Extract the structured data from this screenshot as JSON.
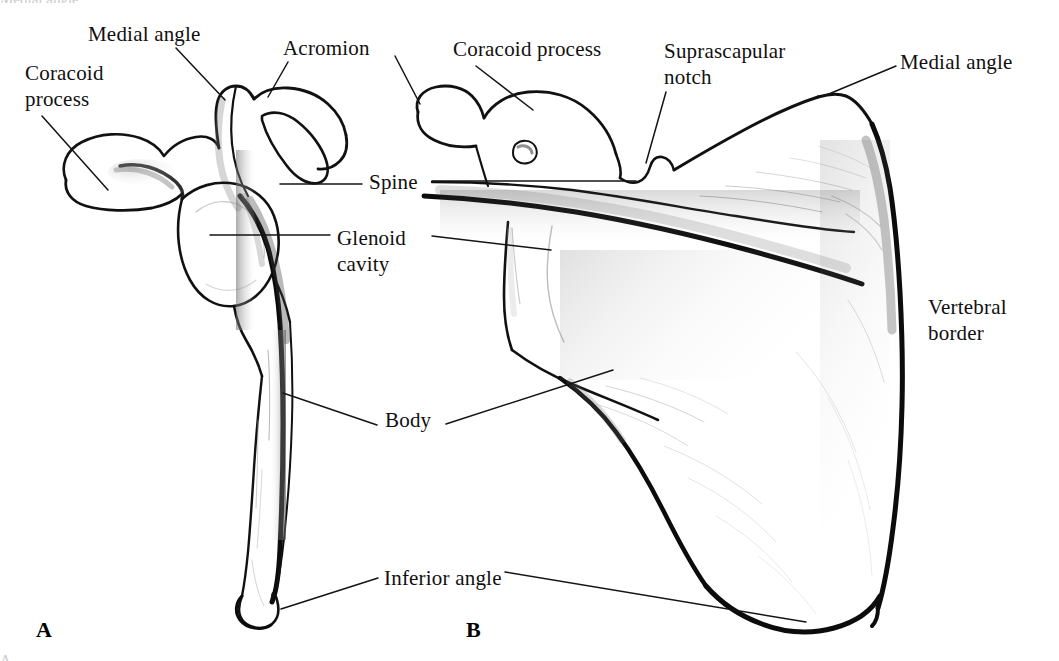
{
  "figure": {
    "background_color": "#ffffff",
    "ink_color": "#101010",
    "width": 1059,
    "height": 661
  },
  "panels": [
    {
      "id": "A",
      "letter": "A",
      "view": "anterior",
      "x": 36,
      "y": 617
    },
    {
      "id": "B",
      "letter": "B",
      "view": "posterior",
      "x": 466,
      "y": 617
    }
  ],
  "labels": [
    {
      "id": "coracoid-process-a",
      "text": "Coracoid\nprocess",
      "panel": "A",
      "x": 25,
      "y": 60,
      "leader": {
        "x1": 42,
        "y1": 116,
        "x2": 108,
        "y2": 190
      }
    },
    {
      "id": "medial-angle-a",
      "text": "Medial angle",
      "panel": "A",
      "x": 88,
      "y": 22,
      "leader": {
        "x1": 176,
        "y1": 48,
        "x2": 225,
        "y2": 100
      }
    },
    {
      "id": "acromion-a",
      "text": "Acromion",
      "panel": "A",
      "x": 283,
      "y": 36,
      "leader": {
        "x1": 288,
        "y1": 62,
        "x2": 268,
        "y2": 97
      }
    },
    {
      "id": "coracoid-process-b",
      "text": "Coracoid process",
      "panel": "B",
      "x": 453,
      "y": 37,
      "leader": {
        "x1": 476,
        "y1": 66,
        "x2": 533,
        "y2": 110
      }
    },
    {
      "id": "suprascapular-notch-b",
      "text": "Suprascapular\nnotch",
      "panel": "B",
      "x": 664,
      "y": 38,
      "leader": {
        "x1": 666,
        "y1": 92,
        "x2": 646,
        "y2": 163
      }
    },
    {
      "id": "medial-angle-b",
      "text": "Medial angle",
      "panel": "B",
      "x": 900,
      "y": 50,
      "leader": {
        "x1": 896,
        "y1": 66,
        "x2": 824,
        "y2": 96
      }
    },
    {
      "id": "spine",
      "text": "Spine",
      "panel": "both",
      "x": 369,
      "y": 170,
      "leader_left": {
        "x1": 280,
        "y1": 184,
        "x2": 362,
        "y2": 184
      },
      "leader_right": {
        "x1": 432,
        "y1": 181,
        "x2": 636,
        "y2": 181
      }
    },
    {
      "id": "glenoid-cavity",
      "text": "Glenoid\ncavity",
      "panel": "both",
      "x": 337,
      "y": 225,
      "leader_left": {
        "x1": 210,
        "y1": 235,
        "x2": 330,
        "y2": 235
      },
      "leader_right": {
        "x1": 432,
        "y1": 236,
        "x2": 551,
        "y2": 250
      }
    },
    {
      "id": "body",
      "text": "Body",
      "panel": "both",
      "x": 385,
      "y": 408,
      "leader_left": {
        "x1": 283,
        "y1": 393,
        "x2": 377,
        "y2": 425
      },
      "leader_right": {
        "x1": 446,
        "y1": 424,
        "x2": 613,
        "y2": 370
      }
    },
    {
      "id": "vertebral-border-b",
      "text": "Vertebral\nborder",
      "panel": "B",
      "x": 928,
      "y": 294,
      "leader": null
    },
    {
      "id": "inferior-angle",
      "text": "Inferior angle",
      "panel": "both",
      "x": 384,
      "y": 566,
      "leader_left": {
        "x1": 281,
        "y1": 609,
        "x2": 378,
        "y2": 578
      },
      "leader_right": {
        "x1": 505,
        "y1": 572,
        "x2": 806,
        "y2": 622
      }
    }
  ],
  "cut_off_text": {
    "top": "Medial angle",
    "bottom": "A"
  }
}
